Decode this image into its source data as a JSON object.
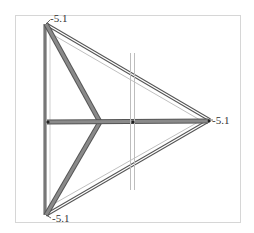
{
  "figure": {
    "type": "3d-truss-wireframe",
    "frame": {
      "x": 15,
      "y": 15,
      "w": 225,
      "h": 207,
      "stroke": "#d8d8d8"
    },
    "labels": [
      {
        "text": "-5.1",
        "x": 50,
        "y": 22
      },
      {
        "text": "-5.1",
        "x": 212,
        "y": 124
      },
      {
        "text": "-5.1",
        "x": 52,
        "y": 222
      }
    ],
    "vertices": {
      "top_left": [
        46,
        24
      ],
      "bottom_left": [
        46,
        215
      ],
      "right": [
        210,
        120
      ],
      "center": [
        100,
        122
      ],
      "mid_left": [
        48,
        122
      ],
      "mid_right": [
        133,
        122
      ]
    },
    "colors": {
      "member_dark": "#555555",
      "member_mid": "#888888",
      "member_light": "#c8c8c8",
      "member_fill": "#8a8a8a",
      "node": "#222222"
    }
  }
}
